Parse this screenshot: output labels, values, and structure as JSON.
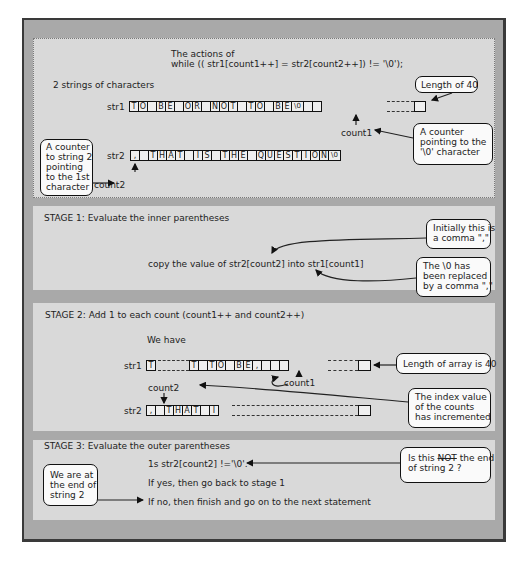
{
  "header": {
    "line1": "The actions of",
    "line2": "while (( str1[count1++] = str2[count2++]) != '\\0');"
  },
  "section0": {
    "title": "2 strings of characters",
    "str1_label": "str1",
    "str2_label": "str2",
    "str1_cells": [
      "T",
      "O",
      " ",
      "B",
      "E",
      " ",
      "O",
      "R",
      " ",
      "N",
      "O",
      "T",
      " ",
      "T",
      "O",
      " ",
      "B",
      "E",
      "\\0",
      "",
      " "
    ],
    "str2_cells": [
      ",",
      " ",
      "T",
      "H",
      "A",
      "T",
      " ",
      "I",
      "S",
      " ",
      "T",
      "H",
      "E",
      " ",
      "Q",
      "U",
      "E",
      "S",
      "T",
      "I",
      "O",
      "N",
      "\\0"
    ],
    "count1_label": "count1",
    "count2_label": "count2",
    "callout_length": "Length of 40",
    "callout_counter1": [
      "A counter",
      "pointing to the",
      "'\\0' character"
    ],
    "callout_counter2": [
      "A counter",
      "to string 2",
      "pointing",
      "to the 1st",
      "character"
    ]
  },
  "stage1": {
    "title": "STAGE 1: Evaluate the inner parentheses",
    "statement": "copy the value of str2[count2] into str1[count1]",
    "callout_initial": [
      "Initially this is",
      "a comma \",\""
    ],
    "callout_replaced": [
      "The \\0 has",
      "been replaced",
      "by a comma \",\""
    ]
  },
  "stage2": {
    "title": "STAGE 2: Add 1 to each count (count1++ and count2++)",
    "we_have": "We have",
    "str1_label": "str1",
    "str2_label": "str2",
    "str1_first": [
      "T"
    ],
    "str1_cells": [
      "T",
      " ",
      "T",
      "O",
      " ",
      "B",
      "E",
      ",",
      " ",
      " ",
      " "
    ],
    "str2_cells": [
      ",",
      " ",
      "T",
      "H",
      "A",
      "T",
      " ",
      "I"
    ],
    "count1_label": "count1",
    "count2_label": "count2",
    "callout_length": "Length of array is 40",
    "callout_index": [
      "The index value",
      "of the counts",
      "has incremented"
    ]
  },
  "stage3": {
    "title": "STAGE 3: Evaluate the outer parentheses",
    "line1": "1s str2[count2] !='\\0'.",
    "line2": "If yes, then go back to stage 1",
    "line3": "If no, then finish and go on to the next statement",
    "callout_not_pre": "Is this ",
    "callout_not_word": "NOT",
    "callout_not_post": " the end",
    "callout_not_line2": "of string 2 ?",
    "callout_end": [
      "We are at",
      "the end of",
      "string 2"
    ]
  }
}
